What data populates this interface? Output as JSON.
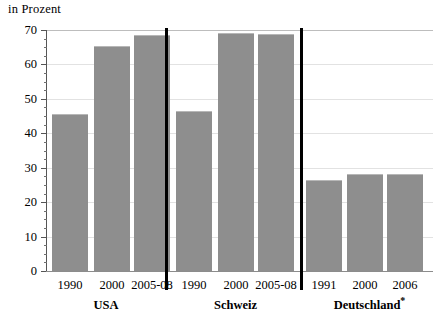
{
  "axis_unit_title": "in Prozent",
  "chart_data": {
    "type": "bar",
    "title": "",
    "subtitle": "",
    "xlabel": "",
    "ylabel": "in Prozent",
    "ylim": [
      0,
      70
    ],
    "y_ticks": [
      0,
      10,
      20,
      30,
      40,
      50,
      60,
      70
    ],
    "y_tick_labels": [
      "0",
      "10",
      "20",
      "30",
      "40",
      "50",
      "60",
      "70"
    ],
    "y_minor_tick_step": 2.5,
    "grid": true,
    "legend": "none",
    "bar_color": "#8e8e8e",
    "groups": [
      {
        "name": "USA",
        "footnote": "",
        "categories": [
          "1990",
          "2000",
          "2005-08"
        ],
        "values": [
          45.5,
          65.5,
          68.5
        ]
      },
      {
        "name": "Schweiz",
        "footnote": "",
        "categories": [
          "1990",
          "2000",
          "2005-08"
        ],
        "values": [
          46.5,
          69.0,
          68.8
        ]
      },
      {
        "name": "Deutschland",
        "footnote": "*",
        "categories": [
          "1991",
          "2000",
          "2006"
        ],
        "values": [
          26.5,
          28.3,
          28.2
        ]
      }
    ],
    "categories": [
      "1990",
      "2000",
      "2005-08",
      "1990",
      "2000",
      "2005-08",
      "1991",
      "2000",
      "2006"
    ],
    "values": [
      45.5,
      65.5,
      68.5,
      46.5,
      69.0,
      68.8,
      26.5,
      28.3,
      28.2
    ],
    "series": [
      {
        "name": "Anteil in Prozent",
        "values": [
          45.5,
          65.5,
          68.5,
          46.5,
          69.0,
          68.8,
          26.5,
          28.3,
          28.2
        ]
      }
    ]
  }
}
